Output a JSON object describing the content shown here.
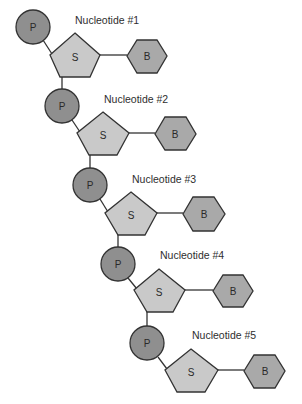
{
  "diagram": {
    "colors": {
      "phosphate_fill": "#8f8f8f",
      "sugar_fill": "#c9c9c9",
      "base_fill": "#a9a9a9",
      "stroke": "#333333",
      "text": "#2e2e2e",
      "background": "#ffffff"
    },
    "legend_symbols": {
      "phosphate": "P",
      "sugar": "S",
      "base": "B"
    },
    "nucleotides": [
      {
        "label": "Nucleotide #1",
        "phosphate": "P",
        "sugar": "S",
        "base": "B"
      },
      {
        "label": "Nucleotide #2",
        "phosphate": "P",
        "sugar": "S",
        "base": "B"
      },
      {
        "label": "Nucleotide #3",
        "phosphate": "P",
        "sugar": "S",
        "base": "B"
      },
      {
        "label": "Nucleotide #4",
        "phosphate": "P",
        "sugar": "S",
        "base": "B"
      },
      {
        "label": "Nucleotide #5",
        "phosphate": "P",
        "sugar": "S",
        "base": "B"
      }
    ]
  }
}
